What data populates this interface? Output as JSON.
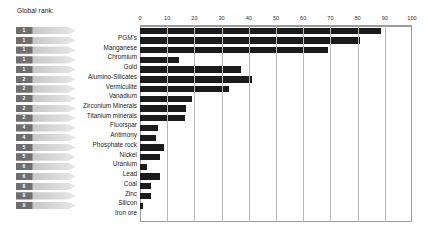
{
  "header": {
    "rank_column_title": "Global rank:"
  },
  "chart_data": {
    "type": "bar",
    "orientation": "horizontal",
    "title": "",
    "xlabel": "",
    "ylabel": "",
    "xlim": [
      0,
      100
    ],
    "xticks": [
      0,
      10,
      20,
      30,
      40,
      50,
      60,
      70,
      80,
      90,
      100
    ],
    "grid": true,
    "legend": null,
    "bar_color": "#1b1b1b",
    "categories": [
      "PGM's",
      "Manganese",
      "Chromium",
      "Gold",
      "Alumino-Silicates",
      "Vermiculite",
      "Vanadium",
      "Zirconium Minerals",
      "Titanium minerals",
      "Fluorspar",
      "Antimony",
      "Phosphate rock",
      "Nickel",
      "Uranium",
      "Lead",
      "Coal",
      "Zinc",
      "Silicon",
      "Iron ore"
    ],
    "values": [
      88.5,
      81,
      69,
      14.3,
      37,
      41,
      32.6,
      19,
      17,
      16.7,
      6.6,
      6,
      8.7,
      7.5,
      2.4,
      7.2,
      3.9,
      4,
      1
    ],
    "ranks": [
      "1",
      "1",
      "1",
      "1",
      "1",
      "2",
      "2",
      "2",
      "2",
      "2",
      "4",
      "4",
      "5",
      "5",
      "6",
      "6",
      "8",
      "9",
      "9"
    ]
  }
}
